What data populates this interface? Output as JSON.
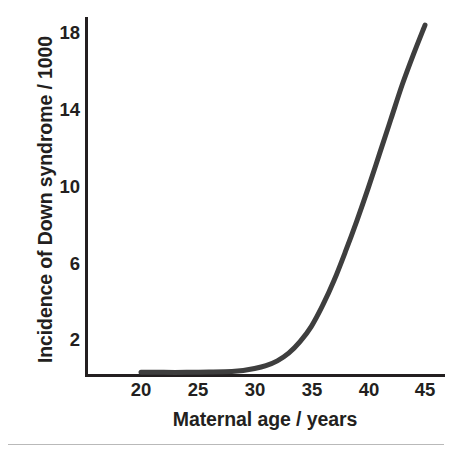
{
  "chart_data": {
    "type": "line",
    "title": "",
    "xlabel": "Maternal age / years",
    "ylabel": "Incidence of Down syndrome / 1000",
    "xlim": [
      18.2,
      46.7
    ],
    "ylim": [
      0.0,
      19.6
    ],
    "grid": false,
    "legend": null,
    "x_ticks": [
      20,
      25,
      30,
      35,
      40,
      45
    ],
    "x_tick_labels": [
      "20",
      "25",
      "30",
      "35",
      "40",
      "45"
    ],
    "y_ticks": [
      2,
      6,
      10,
      14,
      18
    ],
    "y_tick_labels": [
      "2",
      "6",
      "10",
      "14",
      "18"
    ],
    "series": [
      {
        "name": "Incidence of Down syndrome",
        "color": "#3e3e3e",
        "line_width": 5,
        "x": [
          20,
          22,
          24,
          26,
          28,
          29,
          30,
          31,
          32,
          33,
          34,
          35,
          36,
          37,
          38,
          39,
          40,
          41,
          42,
          43,
          44,
          45
        ],
        "values": [
          0.6,
          0.6,
          0.6,
          0.62,
          0.65,
          0.7,
          0.8,
          0.95,
          1.2,
          1.6,
          2.2,
          3.0,
          4.1,
          5.4,
          6.9,
          8.5,
          10.2,
          12.0,
          13.8,
          15.6,
          17.2,
          18.7
        ]
      }
    ]
  },
  "axes": {
    "y_axis_color": "#231f20",
    "x_axis_color": "#231f20",
    "axis_width": 3
  },
  "figure": {
    "background": "#ffffff",
    "rule_color": "#b9b9b9"
  }
}
